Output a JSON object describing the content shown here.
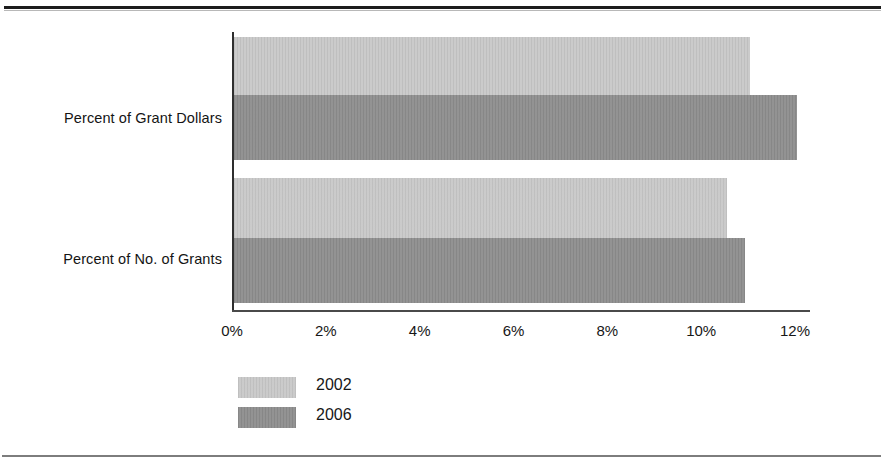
{
  "chart_data": {
    "type": "bar",
    "orientation": "horizontal",
    "title": "",
    "subtitle": "",
    "xlabel": "",
    "ylabel": "",
    "categories": [
      "Percent of Grant Dollars",
      "Percent of No. of Grants"
    ],
    "series": [
      {
        "name": "2002",
        "color": "#c8c8c8",
        "values": [
          11.0,
          10.5
        ]
      },
      {
        "name": "2006",
        "color": "#8e8e8e",
        "values": [
          12.0,
          10.9
        ]
      }
    ],
    "xlim": [
      0,
      12
    ],
    "xticks": [
      0,
      2,
      4,
      6,
      8,
      10,
      12
    ],
    "xtick_labels": [
      "0%",
      "2%",
      "4%",
      "6%",
      "8%",
      "10%",
      "12%"
    ],
    "grid": false,
    "legend_position": "bottom-left",
    "legend_entries": [
      "2002",
      "2006"
    ]
  },
  "axis": {
    "ticks": [
      {
        "label": "0%",
        "value": 0
      },
      {
        "label": "2%",
        "value": 2
      },
      {
        "label": "4%",
        "value": 4
      },
      {
        "label": "6%",
        "value": 6
      },
      {
        "label": "8%",
        "value": 8
      },
      {
        "label": "10%",
        "value": 10
      },
      {
        "label": "12%",
        "value": 12
      }
    ]
  },
  "categories": [
    {
      "label": "Percent of Grant Dollars"
    },
    {
      "label": "Percent of No. of Grants"
    }
  ],
  "legend": {
    "items": [
      {
        "label": "2002",
        "color": "#c8c8c8"
      },
      {
        "label": "2006",
        "color": "#8e8e8e"
      }
    ]
  },
  "colors": {
    "series_2002": "#c8c8c8",
    "series_2006": "#8e8e8e",
    "axis": "#2e2e2e",
    "text": "#141414",
    "rule": "#1d1d1d"
  }
}
